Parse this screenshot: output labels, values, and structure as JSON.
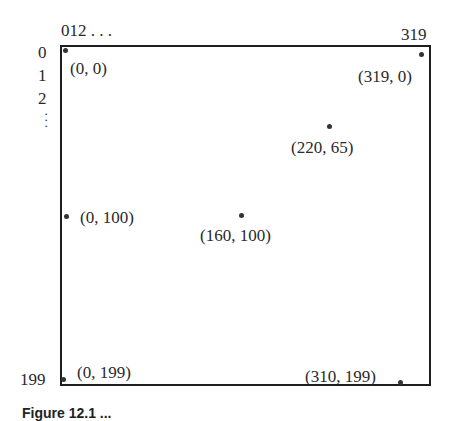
{
  "figure": {
    "top_axis": {
      "start_ticks": "012 . . .",
      "end_tick": "319"
    },
    "left_axis": {
      "ticks": [
        "0",
        "1",
        "2"
      ],
      "ellipsis": ":",
      "end_tick": "199"
    },
    "caption_partial": "Figure 12.1  ..."
  },
  "points": [
    {
      "id": "p1",
      "label": "(0, 0)",
      "x": 0,
      "y": 0
    },
    {
      "id": "p2",
      "label": "(319, 0)",
      "x": 319,
      "y": 0
    },
    {
      "id": "p3",
      "label": "(220, 65)",
      "x": 220,
      "y": 65
    },
    {
      "id": "p4",
      "label": "(0, 100)",
      "x": 0,
      "y": 100
    },
    {
      "id": "p5",
      "label": "(160, 100)",
      "x": 160,
      "y": 100
    },
    {
      "id": "p6",
      "label": "(0, 199)",
      "x": 0,
      "y": 199
    },
    {
      "id": "p7",
      "label": "(310, 199)",
      "x": 310,
      "y": 199
    }
  ],
  "colors": {
    "ink": "#2a2a2a",
    "background": "#ffffff"
  }
}
